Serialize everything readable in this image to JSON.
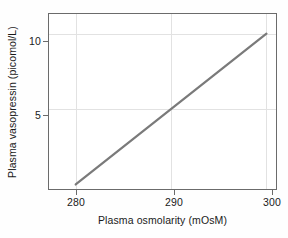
{
  "chart_data": {
    "type": "line",
    "title": "",
    "xlabel": "Plasma osmolarity (mOsM)",
    "ylabel": "Plasma vasopressin (picomol/L)",
    "xlim": [
      277.2,
      301.0
    ],
    "ylim": [
      -0.3,
      11.3
    ],
    "xticks": [
      280,
      290,
      300
    ],
    "xtick_labels": [
      "280",
      "290",
      "300"
    ],
    "yticks": [
      5,
      10
    ],
    "ytick_labels": [
      "5",
      "10"
    ],
    "grid": true,
    "legend": "none",
    "series": [
      {
        "name": "Plasma vasopressin vs osmolarity",
        "x": [
          280,
          300
        ],
        "values": [
          0,
          10
        ],
        "color": "#7a7a7a"
      }
    ],
    "annotations": []
  },
  "axes": {
    "x_tick_0": "280",
    "x_tick_1": "290",
    "x_tick_2": "300",
    "y_tick_0": "5",
    "y_tick_1": "10"
  },
  "colors": {
    "line": "#7a7a7a",
    "frame": "#6b6b6b",
    "grid": "#e2e2e2",
    "text": "#1a1a1a",
    "background": "#fefefe"
  }
}
